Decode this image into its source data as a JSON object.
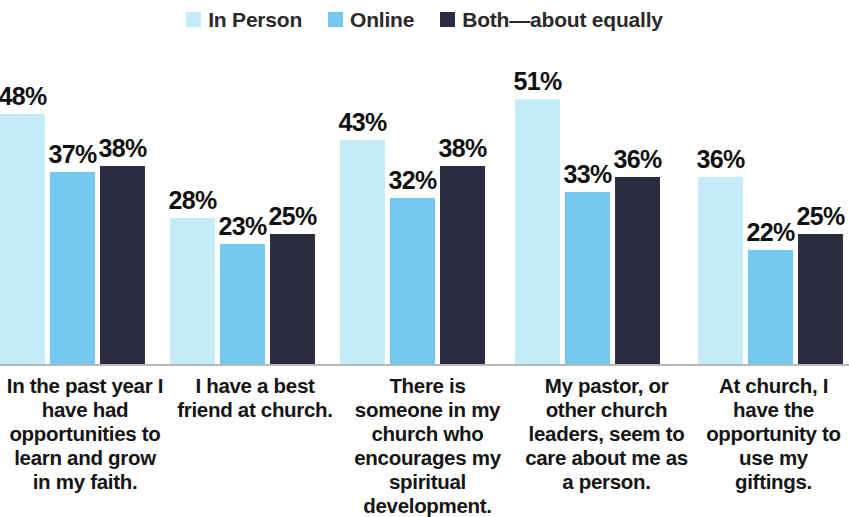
{
  "chart_data": {
    "type": "bar",
    "title": "",
    "subtitle": "",
    "xlabel": "",
    "ylabel": "",
    "ylim": [
      0,
      60
    ],
    "grid": false,
    "legend_position": "top-center",
    "value_label_suffix": "%",
    "categories": [
      "In the past year I have had opportunities to learn and grow in my faith.",
      "I have a best friend at church.",
      "There is someone in my church who encourages my spiritual development.",
      "My pastor, or other church leaders, seem to care about me as a person.",
      "At church, I have the opportunity to use my giftings."
    ],
    "series": [
      {
        "name": "In Person",
        "color": "#c3ebf8",
        "values": [
          48,
          28,
          43,
          51,
          36
        ]
      },
      {
        "name": "Online",
        "color": "#74c8f0",
        "values": [
          37,
          23,
          32,
          33,
          22
        ]
      },
      {
        "name": "Both—about equally",
        "color": "#2b2c41",
        "values": [
          38,
          25,
          38,
          36,
          25
        ]
      }
    ],
    "value_labels": [
      [
        "48%",
        "37%",
        "38%"
      ],
      [
        "28%",
        "23%",
        "25%"
      ],
      [
        "43%",
        "32%",
        "38%"
      ],
      [
        "51%",
        "33%",
        "36%"
      ],
      [
        "36%",
        "22%",
        "25%"
      ]
    ]
  },
  "legend": {
    "items": [
      {
        "label": "In Person",
        "color": "#c3ebf8"
      },
      {
        "label": "Online",
        "color": "#74c8f0"
      },
      {
        "label": "Both—about equally",
        "color": "#2b2c41"
      }
    ]
  },
  "categories_display": [
    "In the past year I have had opportunities to learn and grow in my faith.",
    "I have a best friend at church.",
    "There is someone in my church who encourages my spiritual development.",
    "My pastor, or other church leaders, seem to care about me as a person.",
    "At church, I have the opportunity to use my giftings."
  ],
  "axis": {
    "baseline_color": "#b9b9b9"
  }
}
